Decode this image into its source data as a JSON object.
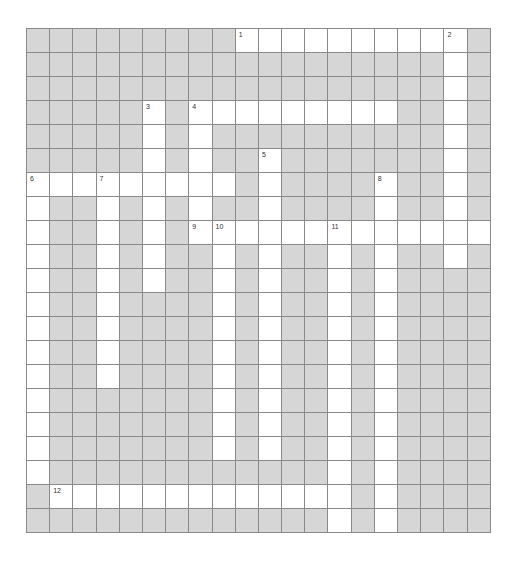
{
  "puzzle": {
    "cols": 20,
    "rows": 21,
    "colors": {
      "block": "#d6d6d6",
      "open": "#ffffff",
      "grid_line": "#8a8a8a",
      "number": "#333333"
    },
    "open_cells_by_row": [
      [
        9,
        10,
        11,
        12,
        13,
        14,
        15,
        16,
        17,
        18
      ],
      [
        18
      ],
      [
        18
      ],
      [
        5,
        7,
        8,
        9,
        10,
        11,
        12,
        13,
        14,
        15,
        18
      ],
      [
        5,
        7,
        18
      ],
      [
        5,
        7,
        10,
        18
      ],
      [
        0,
        1,
        2,
        3,
        4,
        5,
        6,
        7,
        8,
        10,
        15,
        18
      ],
      [
        0,
        3,
        5,
        7,
        10,
        15,
        18
      ],
      [
        0,
        3,
        5,
        7,
        8,
        9,
        10,
        11,
        12,
        13,
        14,
        15,
        16,
        17,
        18,
        19
      ],
      [
        0,
        3,
        5,
        8,
        10,
        13,
        15,
        18
      ],
      [
        0,
        3,
        5,
        8,
        10,
        13,
        15
      ],
      [
        0,
        3,
        8,
        10,
        13,
        15
      ],
      [
        0,
        3,
        8,
        10,
        13,
        15
      ],
      [
        0,
        3,
        8,
        10,
        13,
        15
      ],
      [
        0,
        3,
        8,
        10,
        13,
        15
      ],
      [
        0,
        8,
        10,
        13,
        15
      ],
      [
        0,
        8,
        10,
        13,
        15
      ],
      [
        0,
        8,
        10,
        13,
        15
      ],
      [
        0,
        13,
        15
      ],
      [
        1,
        2,
        3,
        4,
        5,
        6,
        7,
        8,
        9,
        10,
        11,
        12,
        13,
        15
      ],
      [
        13,
        15
      ]
    ],
    "clue_numbers": [
      {
        "number": "1",
        "row": 0,
        "col": 9
      },
      {
        "number": "2",
        "row": 0,
        "col": 18
      },
      {
        "number": "3",
        "row": 3,
        "col": 5
      },
      {
        "number": "4",
        "row": 3,
        "col": 7
      },
      {
        "number": "5",
        "row": 5,
        "col": 10
      },
      {
        "number": "6",
        "row": 6,
        "col": 0
      },
      {
        "number": "7",
        "row": 6,
        "col": 3
      },
      {
        "number": "8",
        "row": 6,
        "col": 15
      },
      {
        "number": "9",
        "row": 8,
        "col": 7
      },
      {
        "number": "10",
        "row": 8,
        "col": 8
      },
      {
        "number": "11",
        "row": 8,
        "col": 13
      },
      {
        "number": "12",
        "row": 19,
        "col": 1
      }
    ]
  }
}
